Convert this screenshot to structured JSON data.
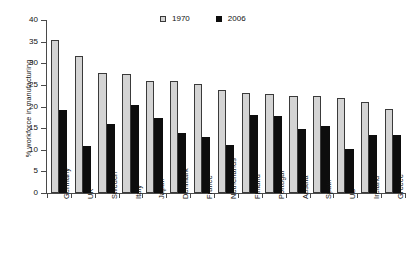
{
  "chart_data": {
    "type": "bar",
    "title": "",
    "xlabel": "",
    "ylabel": "% workforce in manufacturing",
    "ylim": [
      0,
      40
    ],
    "yticks": [
      0,
      5,
      10,
      15,
      20,
      25,
      30,
      35,
      40
    ],
    "grid": false,
    "legend_position": "top-center",
    "categories": [
      "Germany",
      "UK",
      "Sweden",
      "Italy",
      "Japan",
      "Denmark",
      "France",
      "Netherlands",
      "Finland",
      "Portugal",
      "Austria",
      "Spain",
      "US",
      "Ireland",
      "Greece"
    ],
    "series": [
      {
        "name": "1970",
        "color": "#d4d4d4",
        "values": [
          35.3,
          31.7,
          27.7,
          27.6,
          25.9,
          25.9,
          25.1,
          23.9,
          23.1,
          22.9,
          22.5,
          22.4,
          21.9,
          21.0,
          19.5
        ]
      },
      {
        "name": "2006",
        "color": "#0d0d0d",
        "values": [
          19.2,
          10.9,
          16.0,
          20.3,
          17.4,
          13.8,
          13.0,
          11.1,
          18.0,
          17.8,
          14.9,
          15.6,
          10.1,
          13.4,
          13.4
        ]
      }
    ]
  },
  "legend": {
    "items": [
      {
        "label": "1970",
        "marker": "square-light-swatch"
      },
      {
        "label": "2006",
        "marker": "square-dark-swatch"
      }
    ]
  }
}
